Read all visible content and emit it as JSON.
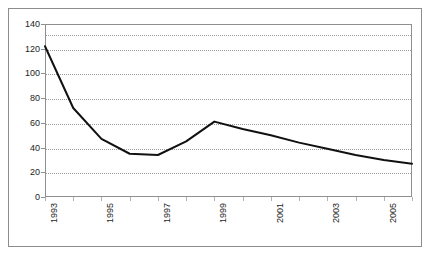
{
  "chart_data": {
    "type": "line",
    "title": "",
    "subtitle": "",
    "xlabel": "",
    "ylabel": "",
    "x": [
      1993,
      1994,
      1995,
      1996,
      1997,
      1998,
      1999,
      2000,
      2001,
      2002,
      2003,
      2004,
      2005,
      2006
    ],
    "values": [
      122,
      72,
      47,
      35,
      34,
      45,
      61,
      55,
      50,
      44,
      39,
      34,
      30,
      27
    ],
    "series": [
      {
        "name": "series-1",
        "values": [
          122,
          72,
          47,
          35,
          34,
          45,
          61,
          55,
          50,
          44,
          39,
          34,
          30,
          27
        ],
        "color": "#111111"
      }
    ],
    "xlim": [
      1993,
      2006
    ],
    "ylim": [
      0,
      140
    ],
    "y_ticks": [
      0,
      20,
      40,
      60,
      80,
      100,
      120,
      140
    ],
    "y_tick_labels": [
      "0",
      "20",
      "40",
      "60",
      "80",
      "100",
      "120",
      "140"
    ],
    "x_ticks": [
      1993,
      1994,
      1995,
      1996,
      1997,
      1998,
      1999,
      2000,
      2001,
      2002,
      2003,
      2004,
      2005,
      2006
    ],
    "x_tick_labels": [
      "1993",
      "",
      "1995",
      "",
      "1997",
      "",
      "1999",
      "",
      "2001",
      "",
      "2003",
      "",
      "2005",
      ""
    ],
    "x_tick_labels_shown": [
      "1993",
      "1995",
      "1997",
      "1999",
      "2001",
      "2003",
      "2005"
    ],
    "x_tick_label_rotation": -90,
    "grid": {
      "horizontal": true,
      "vertical": false,
      "style": "dotted",
      "color": "#9a9a9a",
      "levels": [
        20,
        40,
        60,
        80,
        100,
        120,
        132
      ]
    },
    "legend": {
      "visible": false,
      "position": "none",
      "entries": []
    },
    "line_color": "#111111",
    "line_width": 2,
    "markers": "none",
    "background_color": "#ffffff",
    "frame_color": "#8f8f8f",
    "outer_border_color": "#8d8d8d",
    "annotations": []
  }
}
